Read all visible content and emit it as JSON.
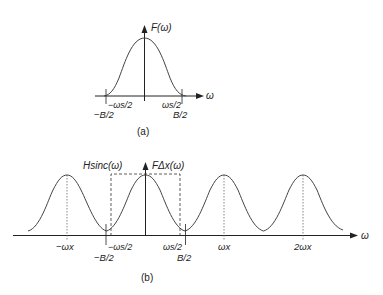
{
  "colors": {
    "ink": "#222222",
    "curve": "#444444",
    "background": "#ffffff"
  },
  "panel_a": {
    "caption": "(a)",
    "y_label": "F(ω)",
    "x_label": "ω",
    "tick_labels": {
      "neg_ws2": "−ωs/2",
      "neg_b2": "−B/2",
      "pos_ws2": "ωs/2",
      "pos_b2": "B/2"
    }
  },
  "panel_b": {
    "caption": "(b)",
    "filter_label": "Hsinc(ω)",
    "spectrum_label": "FΔx(ω)",
    "x_label": "ω",
    "tick_labels": {
      "neg_wx": "−ωx",
      "neg_ws2": "−ωs/2",
      "neg_b2": "−B/2",
      "pos_ws2": "ωs/2",
      "pos_b2": "B/2",
      "wx": "ωx",
      "two_wx": "2ωx"
    }
  }
}
